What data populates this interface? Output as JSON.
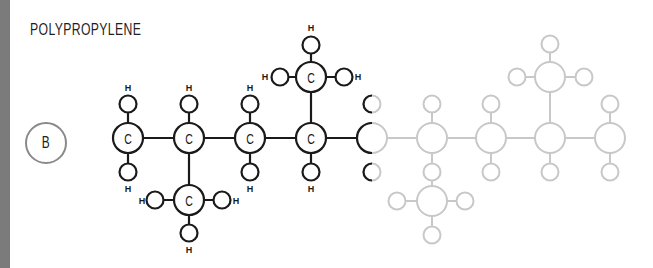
{
  "title": "POLYPROPYLENE",
  "badge": "B",
  "atoms": {
    "carbon": "C",
    "hydrogen": "H"
  },
  "colors": {
    "side_bar": "#7b7b7b",
    "active": "#1a1a1a",
    "faded": "#c8c8c8",
    "badge_border": "#8a8a8a"
  },
  "diagram": {
    "black_carbons": 6,
    "grey_carbons": 6
  }
}
